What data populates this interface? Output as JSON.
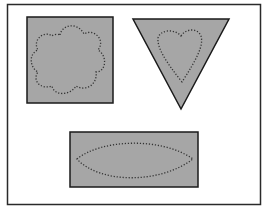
{
  "diagram": {
    "colors": {
      "fill": "#a6a6a6",
      "stroke": "#1a1a1a",
      "frame": "#2a2a2a",
      "background": "#ffffff"
    },
    "shapes": [
      {
        "outer": "square",
        "inner": "flower",
        "inner_style": "dotted"
      },
      {
        "outer": "inverted-triangle",
        "inner": "heart",
        "inner_style": "dotted"
      },
      {
        "outer": "rectangle",
        "inner": "lens",
        "inner_style": "dotted"
      }
    ]
  }
}
